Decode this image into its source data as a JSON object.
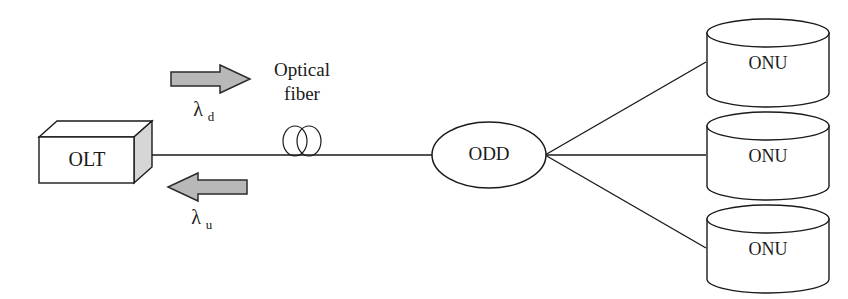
{
  "diagram": {
    "colors": {
      "line": "#1a1a1a",
      "arrow_fill": "#b8b8b8",
      "box_shade": "#d6d6d6",
      "background": "#ffffff"
    },
    "olt": {
      "label": "OLT"
    },
    "odd": {
      "label": "ODD"
    },
    "fiber": {
      "label_line1": "Optical",
      "label_line2": "fiber"
    },
    "downstream": {
      "lambda": "λ",
      "subscript": "d",
      "direction": "right"
    },
    "upstream": {
      "lambda": "λ",
      "subscript": "u",
      "direction": "left"
    },
    "onus": [
      {
        "label": "ONU"
      },
      {
        "label": "ONU"
      },
      {
        "label": "ONU"
      }
    ]
  }
}
